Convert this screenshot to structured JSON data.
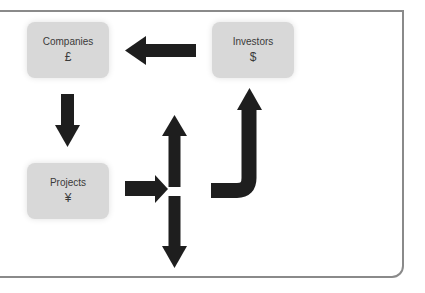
{
  "diagram": {
    "nodes": [
      {
        "id": "companies",
        "label": "Companies",
        "symbol": "£"
      },
      {
        "id": "investors",
        "label": "Investors",
        "symbol": "$"
      },
      {
        "id": "projects",
        "label": "Projects",
        "symbol": "¥"
      }
    ],
    "edges": [
      {
        "from": "investors",
        "to": "companies",
        "direction": "left"
      },
      {
        "from": "companies",
        "to": "projects",
        "direction": "down"
      },
      {
        "from": "projects",
        "to": "split",
        "direction": "right"
      },
      {
        "from": "split",
        "to": "up",
        "direction": "up"
      },
      {
        "from": "split",
        "to": "down",
        "direction": "down"
      },
      {
        "from": "return",
        "to": "investors",
        "direction": "up-curved"
      }
    ],
    "colors": {
      "node_fill": "#d8d8d8",
      "arrow": "#1e1e1e",
      "frame": "#8a8a8a"
    }
  }
}
